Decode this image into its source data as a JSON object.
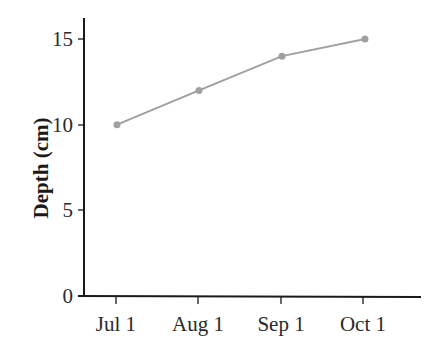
{
  "chart_data": {
    "type": "line",
    "title": "",
    "xlabel": "",
    "ylabel": "Depth (cm)",
    "categories": [
      "Jul 1",
      "Aug 1",
      "Sep 1",
      "Oct 1"
    ],
    "values": [
      10,
      12,
      14,
      15
    ],
    "yticks": [
      "0",
      "5",
      "10",
      "15"
    ],
    "ylim": [
      0,
      16
    ],
    "grid": false,
    "legend": null,
    "line_color": "#a0a0a0"
  }
}
